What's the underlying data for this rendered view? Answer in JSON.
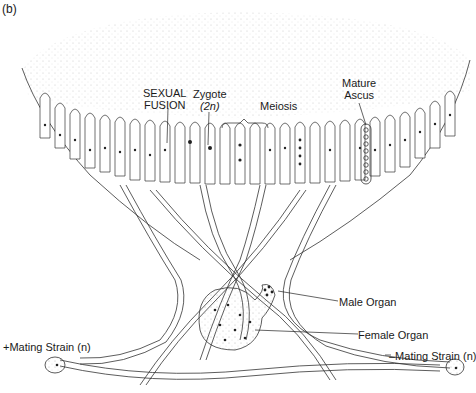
{
  "figure": {
    "panel_label": "(b)",
    "labels": {
      "sexual_fusion_line1": "SEXUAL",
      "sexual_fusion_line2": "FUSION",
      "zygote_line1": "Zygote",
      "zygote_line2": "(2n)",
      "meiosis": "Meiosis",
      "mature_ascus_line1": "Mature",
      "mature_ascus_line2": "Ascus",
      "male_organ": "Male Organ",
      "female_organ": "Female Organ",
      "minus_strain": "–Mating Strain (n)",
      "plus_strain": "+Mating Strain (n)"
    },
    "colors": {
      "ink": "#1a1a1a",
      "hyphae_stroke": "#333333",
      "stipple": "#9a9a9a",
      "background": "#ffffff"
    }
  }
}
